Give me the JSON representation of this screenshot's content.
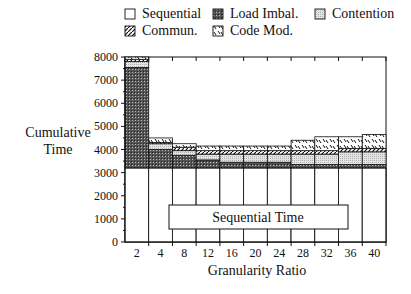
{
  "chart_data": {
    "type": "bar",
    "stacked": true,
    "title": "",
    "xlabel": "Granularity Ratio",
    "ylabel": "Cumulative Time",
    "ylim": [
      0,
      8000
    ],
    "yticks": [
      0,
      1000,
      2000,
      3000,
      4000,
      5000,
      6000,
      7000,
      8000
    ],
    "categories": [
      "2",
      "4",
      "8",
      "12",
      "16",
      "20",
      "24",
      "28",
      "32",
      "36",
      "40"
    ],
    "series": [
      {
        "name": "Sequential",
        "values": [
          3200,
          3200,
          3200,
          3200,
          3200,
          3200,
          3200,
          3200,
          3200,
          3200,
          3200
        ]
      },
      {
        "name": "Load Imbal.",
        "values": [
          4350,
          800,
          550,
          350,
          250,
          250,
          250,
          150,
          150,
          150,
          150
        ]
      },
      {
        "name": "Contention",
        "values": [
          250,
          250,
          200,
          250,
          350,
          350,
          350,
          450,
          450,
          550,
          550
        ]
      },
      {
        "name": "Commun.",
        "values": [
          100,
          50,
          150,
          150,
          150,
          150,
          150,
          150,
          150,
          150,
          150
        ]
      },
      {
        "name": "Code Mod.",
        "values": [
          100,
          200,
          150,
          200,
          200,
          200,
          200,
          450,
          600,
          500,
          600
        ]
      }
    ],
    "annotations": [
      "Sequential Time"
    ],
    "legend": {
      "position": "top",
      "entries": [
        "Sequential",
        "Load Imbal.",
        "Contention",
        "Commun.",
        "Code Mod."
      ]
    },
    "grid": false
  },
  "legend": {
    "items": [
      {
        "label": "Sequential"
      },
      {
        "label": "Load Imbal."
      },
      {
        "label": "Contention"
      },
      {
        "label": "Commun."
      },
      {
        "label": "Code Mod."
      }
    ]
  },
  "axes": {
    "ylabel_line1": "Cumulative",
    "ylabel_line2": "Time",
    "xlabel": "Granularity Ratio"
  },
  "annotation": {
    "text": "Sequential Time"
  }
}
